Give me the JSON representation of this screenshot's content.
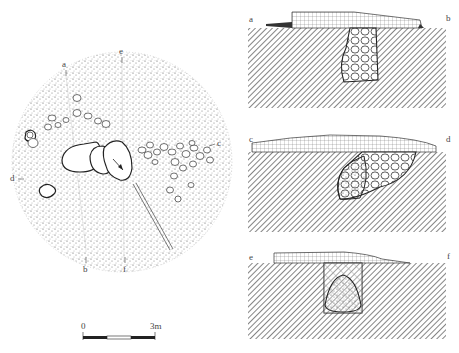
{
  "plan": {
    "labels": {
      "a": "a",
      "b": "b",
      "c": "c",
      "d": "d",
      "e": "e",
      "f": "f"
    }
  },
  "sections": [
    {
      "left": "a",
      "right": "b"
    },
    {
      "left": "c",
      "right": "d"
    },
    {
      "left": "e",
      "right": "f"
    }
  ],
  "scale_bar": {
    "start": "0",
    "end": "3m"
  },
  "colors": {
    "ink": "#222222",
    "stipple": "#555555",
    "hatch": "#666666",
    "background": "#ffffff"
  }
}
